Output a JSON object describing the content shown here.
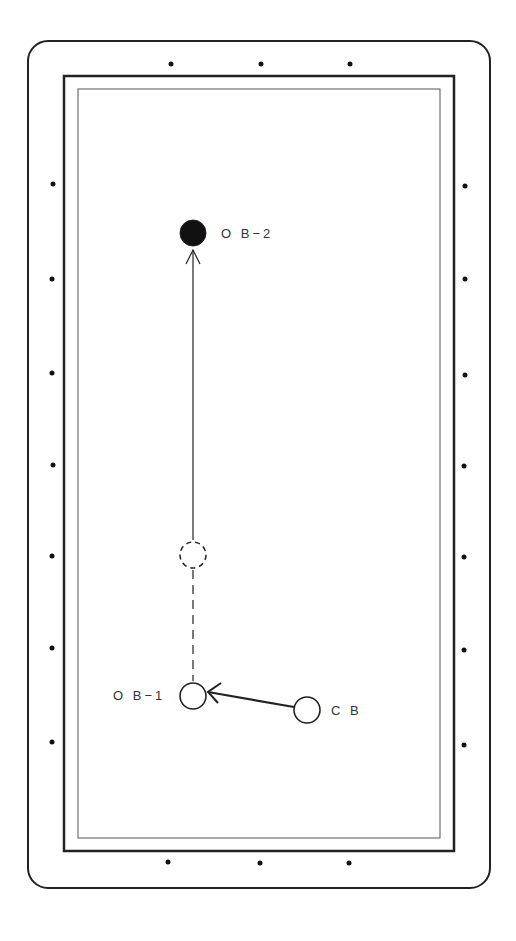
{
  "colors": {
    "line": "#222222",
    "diamond": "#111111",
    "background": "#ffffff",
    "ob2_fill": "#111111"
  },
  "table": {
    "outer": {
      "x": 28,
      "y": 41,
      "w": 462,
      "h": 847,
      "r": 20
    },
    "rail": {
      "x": 64,
      "y": 76,
      "w": 390,
      "h": 775
    },
    "cloth": {
      "x": 78,
      "y": 89,
      "w": 362,
      "h": 749
    }
  },
  "diamonds": {
    "top": [
      [
        171,
        64
      ],
      [
        261,
        64
      ],
      [
        350,
        64
      ]
    ],
    "bottom": [
      [
        168,
        862
      ],
      [
        260,
        863
      ],
      [
        349,
        863
      ]
    ],
    "left": [
      [
        53,
        184
      ],
      [
        52,
        279
      ],
      [
        52,
        373
      ],
      [
        53,
        465
      ],
      [
        52,
        556
      ],
      [
        52,
        648
      ],
      [
        52,
        742
      ]
    ],
    "right": [
      [
        465,
        186
      ],
      [
        465,
        279
      ],
      [
        465,
        375
      ],
      [
        464,
        466
      ],
      [
        464,
        557
      ],
      [
        464,
        650
      ],
      [
        464,
        745
      ]
    ]
  },
  "balls": {
    "ob2": {
      "label": "O B−2",
      "cx": 193,
      "cy": 233,
      "r": 13,
      "label_x": 221,
      "label_y": 238
    },
    "ghost": {
      "cx": 193,
      "cy": 555,
      "r": 13
    },
    "ob1": {
      "label": "O B−1",
      "cx": 193,
      "cy": 696,
      "r": 13,
      "label_x": 113,
      "label_y": 700
    },
    "cb": {
      "label": "C B",
      "cx": 307,
      "cy": 710,
      "r": 13,
      "label_x": 331,
      "label_y": 715
    }
  },
  "paths": {
    "ob2_path": {
      "x1": 193,
      "y1": 250,
      "x2": 193,
      "y2": 540,
      "style": "solid"
    },
    "ghost_to_ob1": {
      "x1": 193,
      "y1": 570,
      "x2": 193,
      "y2": 681,
      "style": "dashed"
    },
    "cb_path": {
      "x1": 294,
      "y1": 707,
      "x2": 208,
      "y2": 692,
      "style": "solid-arrow"
    }
  }
}
